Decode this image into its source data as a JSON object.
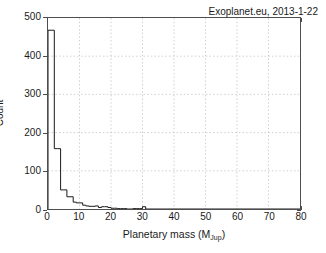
{
  "figure": {
    "background": "#ffffff",
    "frame_color": "#4d4d4d",
    "line_color": "#1a1a1a",
    "grid_color": "#bbbbbb"
  },
  "annotation": {
    "text": "Exoplanet.eu, 2013-1-22"
  },
  "axes": {
    "xlabel_main": "Planetary mass (M",
    "xlabel_sub": "Jup",
    "xlabel_close": ")",
    "ylabel": "Count",
    "xticks": [
      0,
      10,
      20,
      30,
      40,
      50,
      60,
      70,
      80
    ],
    "yticks": [
      0,
      100,
      200,
      300,
      400,
      500
    ],
    "xlim": [
      0,
      80
    ],
    "ylim": [
      0,
      500
    ]
  },
  "chart_data": {
    "type": "bar",
    "title": "",
    "subtitle": "",
    "xlabel": "Planetary mass (M_Jup)",
    "ylabel": "Count",
    "xlim": [
      0,
      80
    ],
    "ylim": [
      0,
      500
    ],
    "grid": true,
    "legend": null,
    "annotations": [
      "Exoplanet.eu, 2013-1-22"
    ],
    "bin_width": 1,
    "style": "step-histogram",
    "bin_edges": [
      0,
      1,
      2,
      3,
      4,
      5,
      6,
      7,
      8,
      9,
      10,
      11,
      12,
      13,
      14,
      15,
      16,
      17,
      18,
      19,
      20,
      21,
      22,
      23,
      24,
      25,
      26,
      27,
      28,
      29,
      30,
      31,
      32,
      33,
      34,
      35,
      36,
      37,
      38,
      39,
      40
    ],
    "bin_centers": [
      0.5,
      1.5,
      2.5,
      3.5,
      4.5,
      5.5,
      6.5,
      7.5,
      8.5,
      9.5,
      10.5,
      11.5,
      12.5,
      13.5,
      14.5,
      15.5,
      16.5,
      17.5,
      18.5,
      19.5,
      20.5,
      21.5,
      22.5,
      23.5,
      24.5,
      25.5,
      26.5,
      27.5,
      28.5,
      29.5,
      30.5,
      31.5,
      32.5,
      33.5,
      34.5,
      35.5,
      36.5,
      37.5,
      38.5,
      39.5
    ],
    "categories": [
      "0-1",
      "1-2",
      "2-3",
      "3-4",
      "4-5",
      "5-6",
      "6-7",
      "7-8",
      "8-9",
      "9-10",
      "10-11",
      "11-12",
      "12-13",
      "13-14",
      "14-15",
      "15-16",
      "16-17",
      "17-18",
      "18-19",
      "19-20",
      "20-21",
      "21-22",
      "22-23",
      "23-24",
      "24-25",
      "25-26",
      "26-27",
      "27-28",
      "28-29",
      "29-30",
      "30-31",
      "31-32",
      "32-33",
      "33-34",
      "34-35",
      "35-36",
      "36-37",
      "37-38",
      "38-39",
      "39-40"
    ],
    "values": [
      468,
      468,
      158,
      158,
      50,
      50,
      32,
      32,
      18,
      16,
      16,
      10,
      8,
      7,
      7,
      8,
      4,
      6,
      6,
      4,
      2,
      2,
      1,
      1,
      1,
      0,
      0,
      1,
      1,
      1,
      6,
      0,
      0,
      0,
      0,
      0,
      0,
      0,
      0,
      0
    ],
    "series": [
      {
        "name": "Exoplanet mass distribution",
        "values": [
          468,
          468,
          158,
          158,
          50,
          50,
          32,
          32,
          18,
          16,
          16,
          10,
          8,
          7,
          7,
          8,
          4,
          6,
          6,
          4,
          2,
          2,
          1,
          1,
          1,
          0,
          0,
          1,
          1,
          1,
          6,
          0,
          0,
          0,
          0,
          0,
          0,
          0,
          0,
          0
        ]
      }
    ],
    "max_value": 468,
    "total_count": 1470
  }
}
